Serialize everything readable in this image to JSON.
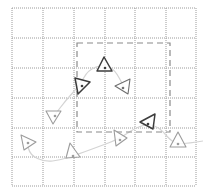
{
  "diagram": {
    "type": "grid-trajectory",
    "grid": {
      "x_lines": [
        12,
        43,
        74,
        105,
        135,
        166,
        196
      ],
      "y_lines": [
        8,
        38,
        68,
        98,
        128,
        157,
        186
      ],
      "color": "#9a9a9a",
      "style": "dotted"
    },
    "region": {
      "x": 77,
      "y": 43,
      "width": 93,
      "height": 89,
      "color": "#8a8a8a",
      "style": "dashed"
    },
    "path": {
      "color": "#d4d4d4",
      "points": [
        [
          27,
          142
        ],
        [
          30,
          155
        ],
        [
          45,
          162
        ],
        [
          60,
          160
        ],
        [
          73,
          156
        ],
        [
          95,
          148
        ],
        [
          119,
          139
        ],
        [
          135,
          128
        ],
        [
          148,
          124
        ],
        [
          160,
          128
        ],
        [
          170,
          140
        ],
        [
          178,
          144
        ],
        [
          190,
          143
        ],
        [
          203,
          141
        ]
      ]
    },
    "path_upper": {
      "color": "#d4d4d4",
      "points": [
        [
          54,
          116
        ],
        [
          66,
          100
        ],
        [
          80,
          85
        ],
        [
          88,
          70
        ],
        [
          104,
          64
        ],
        [
          115,
          70
        ],
        [
          124,
          87
        ]
      ]
    },
    "poses": [
      {
        "id": "p1",
        "points": "21,135 36,142 24,150",
        "dot": [
          28,
          143
        ],
        "shade": "light"
      },
      {
        "id": "p2",
        "points": "46,111 61,111 53,124",
        "dot": [
          55,
          116
        ],
        "shade": "light"
      },
      {
        "id": "p3",
        "points": "75,78 90,82 78,94",
        "dot": [
          82,
          86
        ],
        "shade": "dark"
      },
      {
        "id": "p4",
        "points": "104,57 112,71 97,71",
        "dot": [
          105,
          68
        ],
        "shade": "dark"
      },
      {
        "id": "p5",
        "points": "115,86 130,79 128,94",
        "dot": [
          123,
          88
        ],
        "shade": "medium"
      },
      {
        "id": "p6",
        "points": "70,143 80,157 66,158",
        "dot": [
          73,
          156
        ],
        "shade": "light"
      },
      {
        "id": "p7",
        "points": "114,130 127,138 116,146",
        "dot": [
          120,
          140
        ],
        "shade": "light"
      },
      {
        "id": "p8",
        "points": "140,122 155,114 153,129",
        "dot": [
          148,
          124
        ],
        "shade": "dark"
      },
      {
        "id": "p9",
        "points": "178,132 186,147 170,147",
        "dot": [
          178,
          144
        ],
        "shade": "light"
      }
    ],
    "shades": {
      "light": "#9c9c9c",
      "medium": "#6f6f6f",
      "dark": "#3c3c3c"
    }
  }
}
